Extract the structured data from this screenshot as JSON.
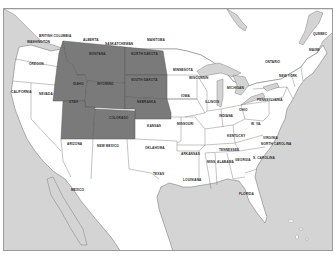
{
  "map": {
    "title": "",
    "colors": {
      "ocean": "#d4d4d4",
      "land": "#ffffff",
      "highlight": "#7a7a7a",
      "border": "#6a6a6a",
      "frame": "#9a9a9a"
    },
    "highlighted_states": [
      "Montana",
      "Idaho",
      "Wyoming",
      "North Dakota",
      "South Dakota",
      "Nebraska",
      "Utah",
      "Colorado"
    ],
    "labels": {
      "british_columbia": "BRITISH COLUMBIA",
      "alberta": "ALBERTA",
      "saskatchewan": "SASKATCHEWAN",
      "manitoba": "MANITOBA",
      "ontario": "ONTARIO",
      "quebec": "QUEBEC",
      "washington": "WASHINGTON",
      "oregon": "OREGON",
      "california": "CALIFORNIA",
      "nevada": "NEVADA",
      "montana": "MONTANA",
      "idaho": "IDAHO",
      "wyoming": "WYOMING",
      "utah": "UTAH",
      "colorado": "COLORADO",
      "arizona": "ARIZONA",
      "new_mexico": "NEW MEXICO",
      "north_dakota": "NORTH DAKOTA",
      "south_dakota": "SOUTH DAKOTA",
      "nebraska": "NEBRASKA",
      "kansas": "KANSAS",
      "oklahoma": "OKLAHOMA",
      "texas": "TEXAS",
      "minnesota": "MINNESOTA",
      "iowa": "IOWA",
      "missouri": "MISSOURI",
      "arkansas": "ARKANSAS",
      "louisiana": "LOUISIANA",
      "wisconsin": "WISCONSIN",
      "illinois": "ILLINOIS",
      "michigan": "MICHIGAN",
      "indiana": "INDIANA",
      "ohio": "OHIO",
      "kentucky": "KENTUCKY",
      "tennessee": "TENNESSEE",
      "mississippi": "MISS.",
      "alabama": "ALABAMA",
      "georgia": "GEORGIA",
      "florida": "FLORIDA",
      "south_carolina": "S. CAROLINA",
      "north_carolina": "NORTH CAROLINA",
      "virginia": "VIRGINIA",
      "west_virginia": "W. VA.",
      "pennsylvania": "PENNSYLVANIA",
      "new_york": "NEW YORK",
      "maine": "MAINE",
      "mexico": "MEXICO"
    }
  }
}
